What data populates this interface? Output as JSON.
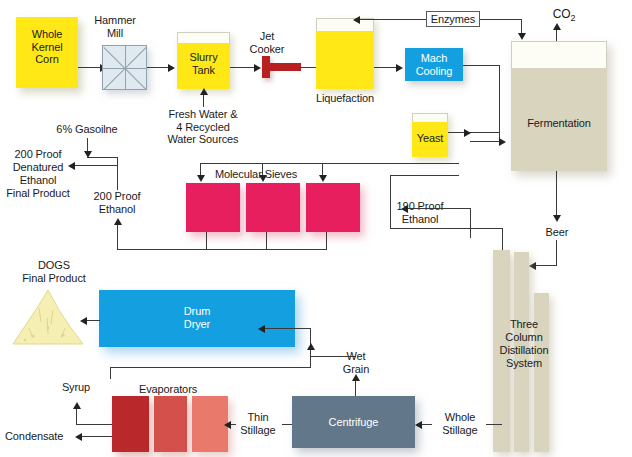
{
  "diagram": {
    "nodes": {
      "whole_kernel_corn": "Whole\nKernel\nCorn",
      "hammer_mill": "Hammer\nMill",
      "slurry_tank": "Slurry\nTank",
      "jet_cooker": "Jet\nCooker",
      "liquefaction": "Liquefaction",
      "mach_cooling": "Mach\nCooling",
      "yeast": "Yeast",
      "enzymes": "Enzymes",
      "co2": "CO",
      "co2_sub": "2",
      "fermentation": "Fermentation",
      "molecular_sieves": "Molecular Sieves",
      "drum_dryer": "Drum\nDryer",
      "evaporators": "Evaporators",
      "centrifuge": "Centrifuge",
      "distillation": "Three\nColumn\nDistillation\nSystem",
      "ddgs_final_product": "DOGS\nFinal Product",
      "denatured_final_product": "200 Proof\nDenatured\nEthanol\nFinal Product"
    },
    "stream_labels": {
      "fresh_water": "Fresh Water &\n4 Recycled\nWater Sources",
      "gasoline": "6% Gasoilne",
      "proof_200": "200 Proof\nEthanol",
      "proof_190": "190 Proof\nEthanol",
      "beer": "Beer",
      "whole_stillage": "Whole\nStillage",
      "thin_stillage": "Thin\nStillage",
      "wet_grain": "Wet\nGrain",
      "syrup": "Syrup",
      "condensate": "Condensate"
    },
    "colors": {
      "tank_yellow": "#ffe815",
      "cooling_cyan": "#139fe0",
      "sieve_magenta": "#e81f5e",
      "centrifuge_slate": "#63778a",
      "column_beige": "#d8d4bd",
      "evaporator_1": "#b9282b",
      "evaporator_2": "#d4504b",
      "evaporator_3": "#e8796b",
      "ddgs_pile": "#f5efb4",
      "mill_fill": "#dfe9ef",
      "cooker_red": "#b8201f",
      "line": "#3a3a3a"
    }
  }
}
